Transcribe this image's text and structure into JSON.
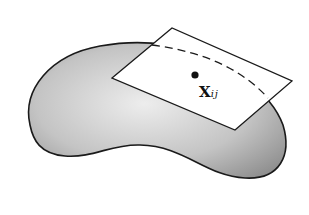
{
  "figure": {
    "point_label": {
      "main": "X",
      "subscript": "ij"
    },
    "colors": {
      "surface_light": "#e8e8e8",
      "surface_dark": "#9a9a9a",
      "outline": "#1a1a1a",
      "plane": "#ffffff"
    }
  }
}
